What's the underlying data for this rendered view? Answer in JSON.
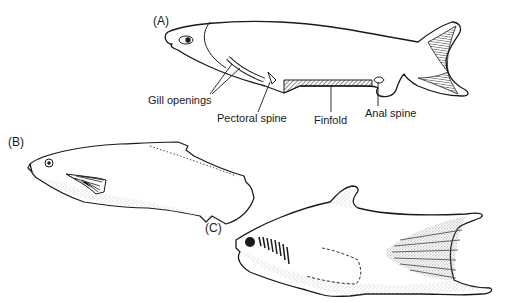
{
  "figure": {
    "panels": [
      {
        "id": "A",
        "label": "(A)",
        "annotations": [
          {
            "key": "gill",
            "text": "Gill openings"
          },
          {
            "key": "pectoral",
            "text": "Pectoral spine"
          },
          {
            "key": "finfold",
            "text": "Finfold"
          },
          {
            "key": "anal",
            "text": "Anal spine"
          }
        ]
      },
      {
        "id": "B",
        "label": "(B)",
        "annotations": []
      },
      {
        "id": "C",
        "label": "(C)",
        "annotations": []
      }
    ],
    "colors": {
      "ink": "#1a1a1a",
      "background": "#ffffff",
      "stipple": "#9a9a9a"
    }
  }
}
